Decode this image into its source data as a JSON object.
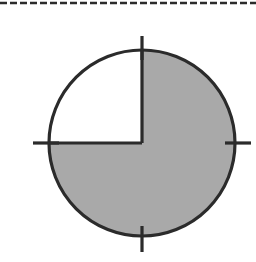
{
  "page": {
    "background_color": "#ffffff",
    "width": 256,
    "height": 262
  },
  "divider": {
    "name": "dashed-rule",
    "label": "",
    "style": "dashed",
    "color": "#2b2b2b",
    "y": 3,
    "x_start": 0,
    "x_end": 256,
    "dash_length": 7,
    "dash_gap": 3,
    "thickness": 2.4
  },
  "figure": {
    "caption": "",
    "center_x": 142,
    "center_y": 143,
    "radius": 93,
    "outline_color": "#2b2b2b",
    "outline_width": 3.2,
    "shaded_color": "#a9a9a9",
    "unshaded_color": "#ffffff",
    "shaded_quadrants": [
      "top-right",
      "bottom-right",
      "bottom-left"
    ],
    "unshaded_quadrants": [
      "top-left"
    ],
    "fraction_shaded": "3/4",
    "fraction_numerator": 3,
    "fraction_denominator": 4,
    "percent_shaded": 75,
    "radius_lines": [
      {
        "name": "radius-up",
        "from_angle_deg": 90,
        "label": ""
      },
      {
        "name": "radius-left",
        "from_angle_deg": 180,
        "label": ""
      }
    ],
    "tick_marks": [
      {
        "name": "tick-top",
        "angle_deg": 90,
        "inner_offset": -10,
        "outer_offset": 14,
        "label": ""
      },
      {
        "name": "tick-right",
        "angle_deg": 0,
        "inner_offset": -10,
        "outer_offset": 16,
        "label": ""
      },
      {
        "name": "tick-bottom",
        "angle_deg": 270,
        "inner_offset": -10,
        "outer_offset": 16,
        "label": ""
      },
      {
        "name": "tick-left",
        "angle_deg": 180,
        "inner_offset": -10,
        "outer_offset": 16,
        "label": ""
      }
    ],
    "tick_color": "#2b2b2b",
    "tick_width": 3.2
  },
  "chart_data": {
    "type": "pie",
    "title": "",
    "subtitle": "",
    "xlabel": "",
    "ylabel": "",
    "grid": false,
    "legend_position": "none",
    "categories": [
      "Shaded",
      "Unshaded"
    ],
    "values": [
      75,
      25
    ],
    "labels": [
      "3/4",
      "1/4"
    ],
    "colors": [
      "#a9a9a9",
      "#ffffff"
    ],
    "slices": [
      {
        "name": "Shaded",
        "value": 75,
        "fraction": "3/4",
        "start_angle_deg": 90,
        "end_angle_deg": 360,
        "color": "#a9a9a9"
      },
      {
        "name": "Unshaded",
        "value": 25,
        "fraction": "1/4",
        "start_angle_deg": 0,
        "end_angle_deg": 90,
        "color": "#ffffff"
      }
    ],
    "annotations": [
      "quarter tick marks at 0, 90, 180 and 270 degrees"
    ]
  }
}
